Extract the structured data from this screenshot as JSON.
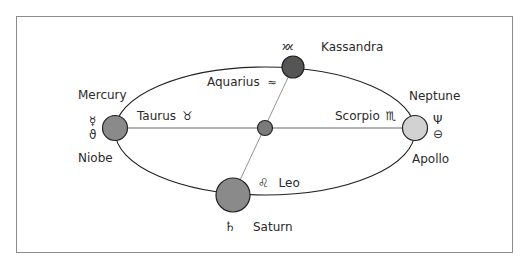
{
  "diagram": {
    "type": "orbital-ellipse",
    "ellipse": {
      "cx": 265,
      "cy": 131,
      "rx": 150,
      "ry": 64,
      "stroke": "#222222"
    },
    "center_body": {
      "cx": 265,
      "cy": 128,
      "r": 7.5,
      "fill": "#7a7a7a"
    },
    "bodies": [
      {
        "id": "mercury",
        "name": "Mercury",
        "symbol": "☿",
        "cx": 115,
        "cy": 128,
        "r": 12.5,
        "fill": "#8a8a8a"
      },
      {
        "id": "niobe",
        "name": "Niobe",
        "symbol": "♁"
      },
      {
        "id": "neptune",
        "name": "Neptune",
        "symbol": "♆",
        "cx": 415,
        "cy": 128,
        "r": 12.5,
        "fill": "#d2d2d2"
      },
      {
        "id": "apollo",
        "name": "Apollo",
        "symbol": "⯓"
      },
      {
        "id": "kassandra",
        "name": "Kassandra",
        "symbol": "⯕",
        "cx": 293,
        "cy": 67,
        "r": 11,
        "fill": "#555555"
      },
      {
        "id": "saturn",
        "name": "Saturn",
        "symbol": "♄",
        "cx": 233,
        "cy": 195,
        "r": 17,
        "fill": "#8a8a8a"
      }
    ],
    "zodiac_labels": [
      {
        "name": "Aquarius",
        "symbol": "♒"
      },
      {
        "name": "Taurus",
        "symbol": "♉"
      },
      {
        "name": "Scorpio",
        "symbol": "♏"
      },
      {
        "name": "Leo",
        "symbol": "♌"
      }
    ]
  },
  "labels": {
    "mercury": "Mercury",
    "mercury_symbol": "☿",
    "niobe": "Niobe",
    "niobe_symbol": "ϑ",
    "neptune": "Neptune",
    "neptune_symbol": "Ψ",
    "apollo": "Apollo",
    "apollo_symbol": "⊖",
    "kassandra": "Kassandra",
    "kassandra_symbol": "ϰϰ",
    "saturn": "Saturn",
    "saturn_symbol": "♄",
    "aquarius": "Aquarius",
    "aquarius_symbol": "≈",
    "taurus": "Taurus",
    "taurus_symbol": "♉",
    "scorpio": "Scorpio",
    "scorpio_symbol": "♏",
    "leo": "Leo",
    "leo_symbol": "♌"
  }
}
